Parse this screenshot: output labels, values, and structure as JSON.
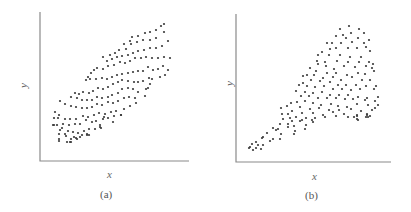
{
  "chart_data": [
    {
      "type": "scatter",
      "title": "",
      "caption": "(a)",
      "xlabel": "x",
      "ylabel": "y",
      "grid": false,
      "legend": null,
      "description": "Elongated elliptical cloud with positive linear correlation",
      "axes_px": {
        "x0": 40,
        "y0": 161,
        "x1": 189,
        "y1": 12
      },
      "points_px": [
        [
          164,
          24
        ],
        [
          161,
          26
        ],
        [
          156,
          30
        ],
        [
          150,
          32
        ],
        [
          145,
          33
        ],
        [
          138,
          36
        ],
        [
          132,
          37
        ],
        [
          130,
          41
        ],
        [
          124,
          44
        ],
        [
          164,
          32
        ],
        [
          156,
          38
        ],
        [
          150,
          40
        ],
        [
          143,
          40
        ],
        [
          137,
          42
        ],
        [
          131,
          44
        ],
        [
          126,
          49
        ],
        [
          119,
          50
        ],
        [
          115,
          53
        ],
        [
          110,
          55
        ],
        [
          168,
          41
        ],
        [
          162,
          46
        ],
        [
          156,
          48
        ],
        [
          150,
          48
        ],
        [
          144,
          50
        ],
        [
          138,
          51
        ],
        [
          133,
          53
        ],
        [
          128,
          55
        ],
        [
          122,
          56
        ],
        [
          117,
          57
        ],
        [
          112,
          59
        ],
        [
          107,
          61
        ],
        [
          103,
          57
        ],
        [
          170,
          58
        ],
        [
          164,
          57
        ],
        [
          158,
          58
        ],
        [
          152,
          58
        ],
        [
          146,
          57
        ],
        [
          141,
          58
        ],
        [
          135,
          58
        ],
        [
          130,
          61
        ],
        [
          125,
          63
        ],
        [
          120,
          62
        ],
        [
          114,
          65
        ],
        [
          108,
          66
        ],
        [
          103,
          69
        ],
        [
          97,
          68
        ],
        [
          94,
          70
        ],
        [
          91,
          73
        ],
        [
          168,
          70
        ],
        [
          163,
          66
        ],
        [
          158,
          69
        ],
        [
          153,
          70
        ],
        [
          148,
          67
        ],
        [
          143,
          71
        ],
        [
          138,
          71
        ],
        [
          133,
          72
        ],
        [
          128,
          73
        ],
        [
          122,
          74
        ],
        [
          117,
          75
        ],
        [
          112,
          77
        ],
        [
          107,
          79
        ],
        [
          102,
          78
        ],
        [
          96,
          79
        ],
        [
          90,
          79
        ],
        [
          88,
          77
        ],
        [
          86,
          80
        ],
        [
          165,
          75
        ],
        [
          160,
          77
        ],
        [
          152,
          79
        ],
        [
          149,
          78
        ],
        [
          143,
          81
        ],
        [
          138,
          82
        ],
        [
          134,
          82
        ],
        [
          128,
          81
        ],
        [
          122,
          80
        ],
        [
          118,
          82
        ],
        [
          113,
          84
        ],
        [
          108,
          87
        ],
        [
          103,
          89
        ],
        [
          98,
          88
        ],
        [
          93,
          91
        ],
        [
          89,
          93
        ],
        [
          83,
          92
        ],
        [
          79,
          94
        ],
        [
          75,
          93
        ],
        [
          150,
          84
        ],
        [
          148,
          88
        ],
        [
          145,
          96
        ],
        [
          138,
          92
        ],
        [
          133,
          89
        ],
        [
          128,
          88
        ],
        [
          122,
          89
        ],
        [
          118,
          93
        ],
        [
          112,
          95
        ],
        [
          108,
          97
        ],
        [
          102,
          98
        ],
        [
          97,
          97
        ],
        [
          92,
          100
        ],
        [
          87,
          100
        ],
        [
          82,
          100
        ],
        [
          77,
          98
        ],
        [
          71,
          97
        ],
        [
          146,
          89
        ],
        [
          135,
          98
        ],
        [
          129,
          97
        ],
        [
          124,
          98
        ],
        [
          118,
          101
        ],
        [
          113,
          103
        ],
        [
          108,
          102
        ],
        [
          102,
          105
        ],
        [
          97,
          104
        ],
        [
          92,
          107
        ],
        [
          87,
          108
        ],
        [
          82,
          108
        ],
        [
          76,
          107
        ],
        [
          71,
          106
        ],
        [
          65,
          104
        ],
        [
          60,
          101
        ],
        [
          136,
          103
        ],
        [
          130,
          106
        ],
        [
          124,
          109
        ],
        [
          116,
          111
        ],
        [
          111,
          112
        ],
        [
          105,
          114
        ],
        [
          99,
          113
        ],
        [
          94,
          115
        ],
        [
          88,
          117
        ],
        [
          83,
          116
        ],
        [
          76,
          119
        ],
        [
          70,
          119
        ],
        [
          65,
          119
        ],
        [
          59,
          115
        ],
        [
          55,
          112
        ],
        [
          121,
          115
        ],
        [
          114,
          116
        ],
        [
          108,
          118
        ],
        [
          103,
          119
        ],
        [
          96,
          121
        ],
        [
          92,
          122
        ],
        [
          86,
          120
        ],
        [
          80,
          124
        ],
        [
          75,
          124
        ],
        [
          69,
          125
        ],
        [
          63,
          124
        ],
        [
          58,
          118
        ],
        [
          54,
          118
        ],
        [
          121,
          115
        ],
        [
          104,
          117
        ],
        [
          100,
          127
        ],
        [
          95,
          129
        ],
        [
          89,
          129
        ],
        [
          84,
          131
        ],
        [
          78,
          133
        ],
        [
          73,
          132
        ],
        [
          68,
          131
        ],
        [
          62,
          128
        ],
        [
          57,
          125
        ],
        [
          54,
          125
        ],
        [
          113,
          122
        ],
        [
          101,
          128
        ],
        [
          87,
          134
        ],
        [
          80,
          137
        ],
        [
          74,
          137
        ],
        [
          66,
          136
        ],
        [
          60,
          130
        ],
        [
          59,
          134
        ],
        [
          53,
          125
        ],
        [
          89,
          135
        ],
        [
          82,
          135
        ],
        [
          76,
          138
        ],
        [
          71,
          139
        ],
        [
          65,
          134
        ],
        [
          59,
          139
        ],
        [
          100,
          125
        ],
        [
          87,
          135
        ],
        [
          77,
          139
        ],
        [
          70,
          142
        ],
        [
          67,
          142
        ],
        [
          59,
          141
        ],
        [
          71,
          142
        ]
      ]
    },
    {
      "type": "scatter",
      "title": "",
      "caption": "(b)",
      "xlabel": "x",
      "ylabel": "y",
      "grid": false,
      "legend": null,
      "description": "Narrow positive-trend band at low x that fans out into a wide cloud at high x (heteroscedastic)",
      "axes_px": {
        "x0": 236,
        "y0": 162,
        "x1": 391,
        "y1": 14
      },
      "points_px": [
        [
          349,
          26
        ],
        [
          340,
          29
        ],
        [
          359,
          29
        ],
        [
          351,
          33
        ],
        [
          364,
          33
        ],
        [
          343,
          35
        ],
        [
          336,
          36
        ],
        [
          358,
          38
        ],
        [
          346,
          38
        ],
        [
          369,
          40
        ],
        [
          327,
          43
        ],
        [
          332,
          43
        ],
        [
          341,
          43
        ],
        [
          352,
          42
        ],
        [
          364,
          43
        ],
        [
          336,
          48
        ],
        [
          330,
          49
        ],
        [
          348,
          48
        ],
        [
          357,
          48
        ],
        [
          366,
          47
        ],
        [
          370,
          51
        ],
        [
          322,
          52
        ],
        [
          318,
          55
        ],
        [
          329,
          55
        ],
        [
          340,
          55
        ],
        [
          350,
          57
        ],
        [
          361,
          57
        ],
        [
          325,
          62
        ],
        [
          317,
          61
        ],
        [
          337,
          61
        ],
        [
          348,
          62
        ],
        [
          359,
          62
        ],
        [
          369,
          62
        ],
        [
          373,
          64
        ],
        [
          310,
          68
        ],
        [
          318,
          64
        ],
        [
          326,
          66
        ],
        [
          334,
          69
        ],
        [
          344,
          66
        ],
        [
          355,
          67
        ],
        [
          366,
          66
        ],
        [
          372,
          68
        ],
        [
          307,
          75
        ],
        [
          316,
          71
        ],
        [
          327,
          73
        ],
        [
          336,
          73
        ],
        [
          347,
          75
        ],
        [
          358,
          73
        ],
        [
          365,
          74
        ],
        [
          374,
          71
        ],
        [
          303,
          76
        ],
        [
          314,
          75
        ],
        [
          323,
          78
        ],
        [
          333,
          77
        ],
        [
          341,
          80
        ],
        [
          352,
          77
        ],
        [
          362,
          80
        ],
        [
          370,
          80
        ],
        [
          303,
          83
        ],
        [
          311,
          80
        ],
        [
          320,
          81
        ],
        [
          330,
          82
        ],
        [
          338,
          85
        ],
        [
          346,
          85
        ],
        [
          356,
          85
        ],
        [
          366,
          86
        ],
        [
          376,
          86
        ],
        [
          299,
          85
        ],
        [
          307,
          86
        ],
        [
          315,
          87
        ],
        [
          324,
          86
        ],
        [
          333,
          89
        ],
        [
          342,
          89
        ],
        [
          351,
          90
        ],
        [
          360,
          89
        ],
        [
          374,
          89
        ],
        [
          296,
          91
        ],
        [
          305,
          92
        ],
        [
          313,
          93
        ],
        [
          322,
          92
        ],
        [
          330,
          95
        ],
        [
          339,
          95
        ],
        [
          348,
          95
        ],
        [
          358,
          97
        ],
        [
          367,
          98
        ],
        [
          378,
          97
        ],
        [
          301,
          96
        ],
        [
          309,
          96
        ],
        [
          318,
          98
        ],
        [
          327,
          98
        ],
        [
          336,
          98
        ],
        [
          345,
          99
        ],
        [
          353,
          99
        ],
        [
          365,
          100
        ],
        [
          375,
          101
        ],
        [
          297,
          102
        ],
        [
          305,
          101
        ],
        [
          313,
          103
        ],
        [
          321,
          105
        ],
        [
          331,
          104
        ],
        [
          338,
          106
        ],
        [
          347,
          107
        ],
        [
          357,
          104
        ],
        [
          368,
          105
        ],
        [
          378,
          105
        ],
        [
          291,
          103
        ],
        [
          300,
          107
        ],
        [
          310,
          109
        ],
        [
          319,
          108
        ],
        [
          329,
          110
        ],
        [
          339,
          110
        ],
        [
          351,
          109
        ],
        [
          361,
          111
        ],
        [
          372,
          110
        ],
        [
          287,
          106
        ],
        [
          292,
          111
        ],
        [
          302,
          113
        ],
        [
          313,
          113
        ],
        [
          323,
          115
        ],
        [
          333,
          112
        ],
        [
          344,
          114
        ],
        [
          357,
          115
        ],
        [
          367,
          114
        ],
        [
          375,
          108
        ],
        [
          281,
          108
        ],
        [
          288,
          114
        ],
        [
          296,
          117
        ],
        [
          306,
          118
        ],
        [
          315,
          118
        ],
        [
          325,
          117
        ],
        [
          336,
          116
        ],
        [
          348,
          117
        ],
        [
          357,
          116
        ],
        [
          367,
          115
        ],
        [
          282,
          114
        ],
        [
          290,
          118
        ],
        [
          302,
          120
        ],
        [
          312,
          120
        ],
        [
          354,
          117
        ],
        [
          366,
          117
        ],
        [
          283,
          119
        ],
        [
          292,
          121
        ],
        [
          300,
          121
        ],
        [
          313,
          122
        ],
        [
          357,
          119
        ],
        [
          368,
          117
        ],
        [
          280,
          124
        ],
        [
          288,
          124
        ],
        [
          294,
          126
        ],
        [
          306,
          125
        ],
        [
          358,
          120
        ],
        [
          370,
          116
        ],
        [
          273,
          128
        ],
        [
          278,
          129
        ],
        [
          288,
          127
        ],
        [
          295,
          131
        ],
        [
          305,
          129
        ],
        [
          276,
          130
        ],
        [
          281,
          134
        ],
        [
          294,
          134
        ],
        [
          263,
          137
        ],
        [
          267,
          133
        ],
        [
          273,
          139
        ],
        [
          280,
          139
        ],
        [
          262,
          138
        ],
        [
          270,
          141
        ],
        [
          256,
          142
        ],
        [
          252,
          144
        ],
        [
          258,
          145
        ],
        [
          263,
          145
        ],
        [
          250,
          147
        ],
        [
          256,
          148
        ],
        [
          261,
          149
        ],
        [
          253,
          150
        ],
        [
          249,
          148
        ]
      ]
    }
  ],
  "panels": [
    {
      "caption": "(a)",
      "xlabel": "x",
      "ylabel": "y"
    },
    {
      "caption": "(b)",
      "xlabel": "x",
      "ylabel": "y"
    }
  ]
}
